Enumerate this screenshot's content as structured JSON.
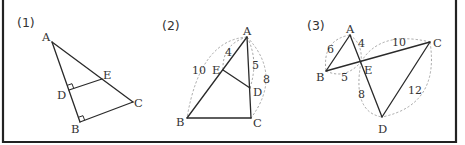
{
  "figure": {
    "frame_color": "#222222",
    "line_color": "#2a2a2a",
    "dash_color": "#9a9a9a"
  },
  "panels": [
    {
      "label": "(1)",
      "points": {
        "A": "A",
        "B": "B",
        "C": "C",
        "D": "D",
        "E": "E"
      },
      "description": "Triangle ABC with DE parallel to BC; right angles marked at D and B"
    },
    {
      "label": "(2)",
      "points": {
        "A": "A",
        "B": "B",
        "C": "C",
        "D": "D",
        "E": "E"
      },
      "lengths": {
        "AE": "4",
        "AB": "10",
        "AD": "5",
        "AC": "8"
      }
    },
    {
      "label": "(3)",
      "points": {
        "A": "A",
        "B": "B",
        "C": "C",
        "D": "D",
        "E": "E"
      },
      "lengths": {
        "AB": "6",
        "AE": "4",
        "EC": "10",
        "BE": "5",
        "ED": "8",
        "CD": "12"
      }
    }
  ]
}
